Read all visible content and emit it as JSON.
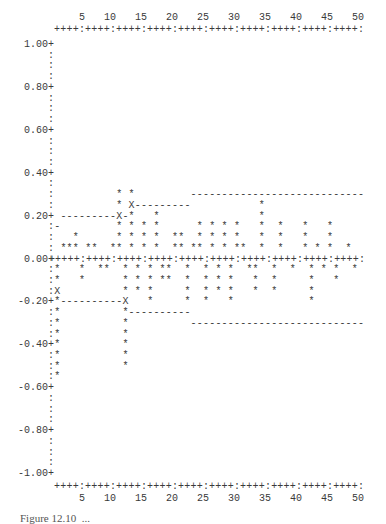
{
  "chart_data": {
    "type": "bar",
    "style": "ascii-correlogram",
    "title": "",
    "xlabel": "",
    "ylabel": "",
    "xlim": [
      1,
      50
    ],
    "ylim": [
      -1.0,
      1.0
    ],
    "x_ticks": [
      5,
      10,
      15,
      20,
      25,
      30,
      35,
      40,
      45,
      50
    ],
    "y_ticks": [
      "1.00",
      "0.80",
      "0.60",
      "0.40",
      "0.20",
      "0.00",
      "-0.20",
      "-0.40",
      "-0.60",
      "-0.80",
      "-1.00"
    ],
    "row_step": 0.05,
    "lags": [
      1,
      2,
      3,
      4,
      5,
      6,
      7,
      8,
      9,
      10,
      11,
      12,
      13,
      14,
      15,
      16,
      17,
      18,
      19,
      20,
      21,
      22,
      23,
      24,
      25,
      26,
      27,
      28,
      29,
      30,
      31,
      32,
      33,
      34,
      35,
      36,
      37,
      38,
      39,
      40,
      41,
      42,
      43,
      44,
      45,
      46,
      47,
      48,
      49,
      50
    ],
    "values": [
      -0.55,
      0.05,
      0.05,
      0.1,
      -0.1,
      0.05,
      0.05,
      -0.05,
      -0.05,
      0.05,
      0.3,
      -0.5,
      0.3,
      -0.15,
      0.15,
      -0.2,
      0.2,
      -0.1,
      -0.1,
      0.1,
      0.1,
      -0.2,
      0.05,
      0.15,
      -0.2,
      0.15,
      -0.15,
      0.15,
      -0.2,
      0.15,
      0.05,
      -0.05,
      -0.15,
      0.25,
      0,
      -0.15,
      0.15,
      0,
      -0.05,
      0,
      0.15,
      -0.2,
      0.05,
      -0.05,
      0.15,
      -0.1,
      0,
      0.05,
      -0.05,
      0
    ],
    "confidence_bands": {
      "upper": [
        {
          "from": 1,
          "to": 1,
          "value": 0.15
        },
        {
          "from": 2,
          "to": 12,
          "value": 0.2
        },
        {
          "from": 13,
          "to": 22,
          "value": 0.25
        },
        {
          "from": 23,
          "to": 50,
          "value": 0.3
        }
      ],
      "lower": [
        {
          "from": 1,
          "to": 1,
          "value": -0.15
        },
        {
          "from": 2,
          "to": 12,
          "value": -0.2
        },
        {
          "from": 13,
          "to": 22,
          "value": -0.25
        },
        {
          "from": 23,
          "to": 50,
          "value": -0.3
        }
      ]
    },
    "markers": {
      "bar": "*",
      "band": "-",
      "band_cross": "X"
    },
    "grid": false,
    "legend": null
  },
  "axis_rule": "++++:++++:++++:++++:++++:++++:++++:++++:++++:++++:",
  "zero_rule": "+++++:++++:++++:++++:++++:++++:++++:++++:++++:++++:",
  "caption": "Figure 12.10  ..."
}
